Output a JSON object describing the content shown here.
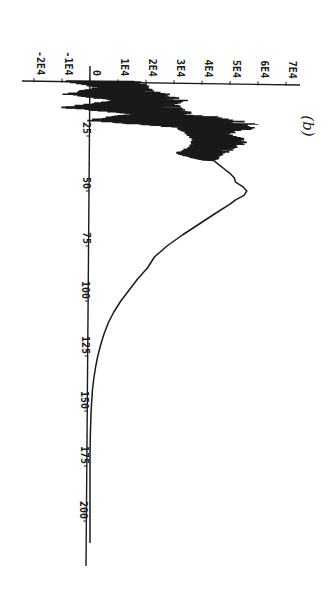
{
  "figure": {
    "panel_label": "(b)",
    "orientation": "rotated 90 degrees clockwise",
    "ink_color": "#1a1a1a",
    "background": "#ffffff"
  },
  "chart_data": {
    "type": "line",
    "title": "",
    "panel": "(b)",
    "xlabel": "",
    "ylabel": "",
    "xlim": [
      0,
      215
    ],
    "ylim": [
      -20000,
      70000
    ],
    "grid": false,
    "legend": null,
    "x_ticks": [
      0,
      25,
      50,
      75,
      100,
      125,
      150,
      175,
      200
    ],
    "x_tick_labels": [
      "",
      "25",
      "50",
      "75",
      "100",
      "125",
      "150",
      "175",
      "200"
    ],
    "y_ticks": [
      -20000,
      -10000,
      0,
      10000,
      20000,
      30000,
      40000,
      50000,
      60000,
      70000
    ],
    "y_tick_labels": [
      "-2E4",
      "-1E4",
      "0",
      "1E4",
      "2E4",
      "3E4",
      "4E4",
      "5E4",
      "6E4",
      "7E4"
    ],
    "series": [
      {
        "name": "signal",
        "description": "Strongly oscillating region (x ≈ 0–35) with spikes reaching negative values, followed by smooth curve peaking near x≈50 and decaying to ~0 by x≈170",
        "oscillation_envelope": {
          "x": [
            0,
            3,
            6,
            9,
            12,
            15,
            18,
            21,
            24,
            27,
            30,
            33,
            36
          ],
          "upper": [
            20000,
            22000,
            30000,
            36000,
            33000,
            38000,
            62000,
            60000,
            50000,
            58000,
            54000,
            48000,
            45000
          ],
          "lower": [
            -10000,
            2000,
            -10000,
            8000,
            -11000,
            15000,
            -4000,
            30000,
            34000,
            36000,
            35000,
            30000,
            40000
          ]
        },
        "x": [
          36,
          38,
          40,
          42,
          44,
          46,
          48,
          50,
          52,
          54,
          56,
          60,
          65,
          70,
          75,
          80,
          85,
          90,
          95,
          100,
          105,
          110,
          115,
          120,
          125,
          130,
          135,
          140,
          150,
          160,
          170,
          180,
          190,
          200,
          210
        ],
        "values": [
          44000,
          46000,
          48000,
          50000,
          51500,
          52000,
          54500,
          56000,
          55000,
          52000,
          50000,
          45000,
          39000,
          33000,
          27500,
          23000,
          20500,
          17000,
          14000,
          11000,
          8500,
          6500,
          5000,
          3800,
          2800,
          2000,
          1400,
          900,
          400,
          150,
          0,
          0,
          0,
          0,
          0
        ]
      }
    ]
  }
}
